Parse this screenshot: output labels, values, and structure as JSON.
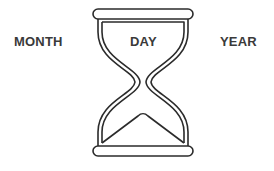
{
  "labels": {
    "month": "MONTH",
    "day": "DAY",
    "year": "YEAR"
  },
  "icon": "hourglass-icon",
  "colors": {
    "stroke": "#2b2b2b",
    "text": "#3a3a3a",
    "background": "#ffffff"
  }
}
